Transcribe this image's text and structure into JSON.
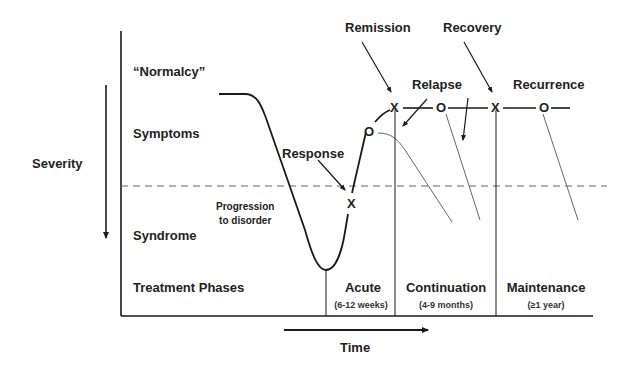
{
  "diagram": {
    "y_axis_label": "Severity",
    "x_axis_label": "Time",
    "levels": [
      {
        "id": "normalcy",
        "label": "“Normalcy”"
      },
      {
        "id": "symptoms",
        "label": "Symptoms"
      },
      {
        "id": "syndrome",
        "label": "Syndrome"
      }
    ],
    "treatment_row_label": "Treatment Phases",
    "phases": [
      {
        "name": "Acute",
        "duration": "(6-12 weeks)"
      },
      {
        "name": "Continuation",
        "duration": "(4-9 months)"
      },
      {
        "name": "Maintenance",
        "duration": "(≥1 year)"
      }
    ],
    "annotations": {
      "progression": [
        "Progression",
        "to disorder"
      ],
      "response": "Response",
      "remission": "Remission",
      "recovery": "Recovery",
      "relapse": "Relapse",
      "recurrence": "Recurrence"
    },
    "markers": {
      "x_symbol": "X",
      "o_symbol": "O"
    },
    "colors": {
      "line": "#1a1a1a",
      "dashed": "#666666",
      "thin": "#555555",
      "background": "#ffffff"
    }
  }
}
